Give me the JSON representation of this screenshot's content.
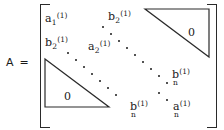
{
  "figure": {
    "kind": "matrix-equation",
    "background_color": "#ffffff",
    "ink_color": "#1a1a1a",
    "lhs": {
      "symbol": "A",
      "equals": "="
    },
    "brackets": {
      "left": "[",
      "right": "]"
    },
    "entries": [
      {
        "id": "a1",
        "position": "top-left",
        "base": "a",
        "subscript": "1",
        "superscript": "(1)",
        "layout": "inline",
        "text": "a₁⁽¹⁾"
      },
      {
        "id": "b2-top",
        "position": "top-center",
        "base": "b",
        "subscript": "2",
        "superscript": "(1)",
        "layout": "inline",
        "clipped": "superscript clipped by top image edge",
        "text": "b₂⁽¹⁾"
      },
      {
        "id": "b2-left",
        "position": "left-second-row",
        "base": "b",
        "subscript": "2",
        "superscript": "(1)",
        "layout": "inline",
        "text": "b₂⁽¹⁾"
      },
      {
        "id": "a2",
        "position": "center-left",
        "base": "a",
        "subscript": "2",
        "superscript": "(1)",
        "layout": "inline",
        "text": "a₂⁽¹⁾"
      },
      {
        "id": "bn-right",
        "position": "right-middle",
        "base": "b",
        "subscript": "n",
        "superscript": "(1)",
        "layout": "stacked",
        "text": "bₙ⁽¹⁾"
      },
      {
        "id": "bn-bottom",
        "position": "bottom-center",
        "base": "b",
        "subscript": "n",
        "superscript": "(1)",
        "layout": "stacked",
        "text": "bₙ⁽¹⁾"
      },
      {
        "id": "an-bottom",
        "position": "bottom-right",
        "base": "a",
        "subscript": "n",
        "superscript": "(1)",
        "layout": "stacked",
        "text": "aₙ⁽¹⁾"
      }
    ],
    "zero_regions": [
      {
        "id": "zero-upper-right",
        "label": "0",
        "shape": "right-triangle",
        "orientation": "upper-right"
      },
      {
        "id": "zero-lower-left",
        "label": "0",
        "shape": "right-triangle",
        "orientation": "lower-left"
      }
    ],
    "ellipses": [
      {
        "id": "diagonal-ellipsis-upper",
        "direction": "down-right",
        "dot_count": 9
      },
      {
        "id": "diagonal-ellipsis-lower",
        "direction": "down-right",
        "dot_count": 9
      }
    ]
  }
}
